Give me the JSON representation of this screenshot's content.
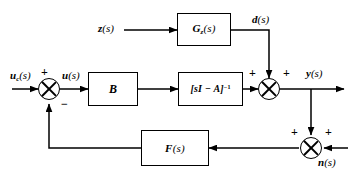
{
  "diagram": {
    "type": "block-diagram",
    "stroke_color": "#000000",
    "background_color": "#ffffff"
  },
  "blocks": [
    {
      "id": "gz",
      "label_main": "G",
      "label_sub": "z",
      "label_args": "(s)",
      "full_label": "Gz(s)",
      "role": "disturbance-transfer-function"
    },
    {
      "id": "b",
      "label_main": "B",
      "label_sub": "",
      "label_args": "",
      "full_label": "B",
      "role": "input-matrix"
    },
    {
      "id": "sia",
      "label_main": "[sI − A]",
      "label_sub": "",
      "label_args": "",
      "label_sup": "−1",
      "full_label": "[sI - A]^-1",
      "role": "plant-resolvent"
    },
    {
      "id": "f",
      "label_main": "F",
      "label_sub": "",
      "label_args": "(s)",
      "full_label": "F(s)",
      "role": "feedback-controller"
    }
  ],
  "signals": {
    "reference": {
      "main": "u",
      "sub": "c",
      "args": "(s)",
      "full": "uc(s)"
    },
    "control": {
      "main": "u",
      "sub": "",
      "args": "(s)",
      "full": "u(s)"
    },
    "disturbance_input": {
      "main": "z",
      "sub": "",
      "args": "(s)",
      "full": "z(s)"
    },
    "disturbance": {
      "main": "d",
      "sub": "",
      "args": "(s)",
      "full": "d(s)"
    },
    "output": {
      "main": "y",
      "sub": "",
      "args": "(s)",
      "full": "y(s)"
    },
    "noise": {
      "main": "n",
      "sub": "",
      "args": "(s)",
      "full": "n(s)"
    }
  },
  "summing_junctions": [
    {
      "id": "error-junction",
      "signs": {
        "reference_input": "+",
        "feedback_input": "−"
      }
    },
    {
      "id": "output-junction",
      "signs": {
        "plant_input": "+",
        "disturbance_input": "+"
      }
    },
    {
      "id": "noise-junction",
      "signs": {
        "output_input": "+",
        "noise_input": "+"
      }
    }
  ],
  "signs": {
    "plus": "+",
    "minus": "−"
  }
}
